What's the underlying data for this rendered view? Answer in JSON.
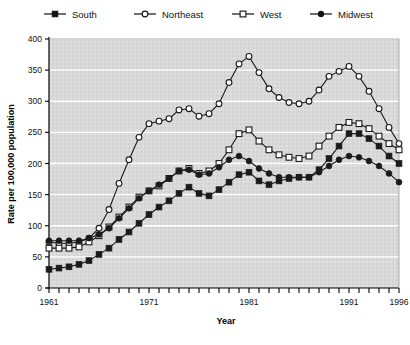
{
  "chart_data": {
    "type": "line",
    "title": "",
    "xlabel": "Year",
    "ylabel": "Rate per 100,000 population",
    "xlim": [
      1961,
      1996
    ],
    "ylim": [
      0,
      400
    ],
    "ytick_values": [
      0,
      50,
      100,
      150,
      200,
      250,
      300,
      350,
      400
    ],
    "ytick_labels": [
      "0",
      "50",
      "100",
      "150",
      "200",
      "250",
      "300",
      "350",
      "400"
    ],
    "xtick_values": [
      1961,
      1971,
      1981,
      1991,
      1996
    ],
    "xtick_labels": [
      "1961",
      "1971",
      "1981",
      "1991",
      "1996"
    ],
    "grid": "horizontal-white",
    "plot_background": "#d6d6d6",
    "legend_position": "top",
    "x": [
      1961,
      1962,
      1963,
      1964,
      1965,
      1966,
      1967,
      1968,
      1969,
      1970,
      1971,
      1972,
      1973,
      1974,
      1975,
      1976,
      1977,
      1978,
      1979,
      1980,
      1981,
      1982,
      1983,
      1984,
      1985,
      1986,
      1987,
      1988,
      1989,
      1990,
      1991,
      1992,
      1993,
      1994,
      1995,
      1996
    ],
    "series": [
      {
        "name": "South",
        "marker": "filled-square",
        "color": "#1a1a1a",
        "values": [
          30,
          32,
          34,
          38,
          44,
          54,
          64,
          78,
          90,
          104,
          118,
          130,
          140,
          152,
          162,
          152,
          148,
          158,
          170,
          182,
          186,
          172,
          166,
          172,
          176,
          178,
          178,
          190,
          208,
          228,
          248,
          248,
          240,
          228,
          212,
          200
        ]
      },
      {
        "name": "Northeast",
        "marker": "open-circle",
        "color": "#1a1a1a",
        "values": [
          74,
          72,
          72,
          74,
          80,
          96,
          126,
          168,
          206,
          242,
          264,
          268,
          272,
          286,
          288,
          276,
          280,
          296,
          330,
          360,
          372,
          346,
          320,
          306,
          298,
          296,
          300,
          318,
          340,
          348,
          356,
          340,
          316,
          288,
          258,
          232
        ]
      },
      {
        "name": "West",
        "marker": "open-square",
        "color": "#1a1a1a",
        "values": [
          64,
          64,
          64,
          66,
          74,
          84,
          98,
          114,
          130,
          146,
          156,
          164,
          176,
          188,
          192,
          184,
          188,
          200,
          222,
          248,
          254,
          236,
          222,
          214,
          210,
          208,
          212,
          228,
          244,
          258,
          266,
          264,
          256,
          244,
          232,
          222
        ]
      },
      {
        "name": "Midwest",
        "marker": "filled-circle",
        "color": "#1a1a1a",
        "values": [
          76,
          76,
          76,
          76,
          80,
          86,
          96,
          112,
          128,
          144,
          156,
          166,
          176,
          188,
          190,
          182,
          184,
          194,
          206,
          212,
          204,
          192,
          184,
          178,
          178,
          178,
          178,
          186,
          196,
          206,
          212,
          210,
          204,
          196,
          184,
          170
        ]
      }
    ]
  },
  "legend": {
    "items": [
      {
        "label": "South",
        "marker": "filled-square"
      },
      {
        "label": "Northeast",
        "marker": "open-circle"
      },
      {
        "label": "West",
        "marker": "open-square"
      },
      {
        "label": "Midwest",
        "marker": "filled-circle"
      }
    ]
  },
  "axes": {
    "x_title": "Year",
    "y_title": "Rate per 100,000 population"
  }
}
